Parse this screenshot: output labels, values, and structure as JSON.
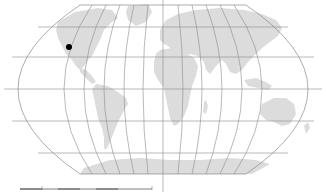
{
  "map": {
    "projection": "pseudocylindrical-world",
    "colors": {
      "background": "#ffffff",
      "land": "#dcdcdc",
      "graticule": "#8a8a8a",
      "marker": "#000000"
    },
    "central_meridian_x": 163,
    "equator_y": 89,
    "parallels_y": [
      27,
      57,
      89,
      121,
      153
    ],
    "pole_lines": {
      "north_y": 5,
      "south_y": 174,
      "x_start": 80,
      "x_end": 245
    },
    "markers": [
      {
        "label": "location-marker",
        "x": 69,
        "y": 47,
        "radius": 3
      }
    ],
    "scale_bar": {
      "x_start": 20,
      "x_end": 152,
      "y": 189,
      "label": ""
    }
  }
}
